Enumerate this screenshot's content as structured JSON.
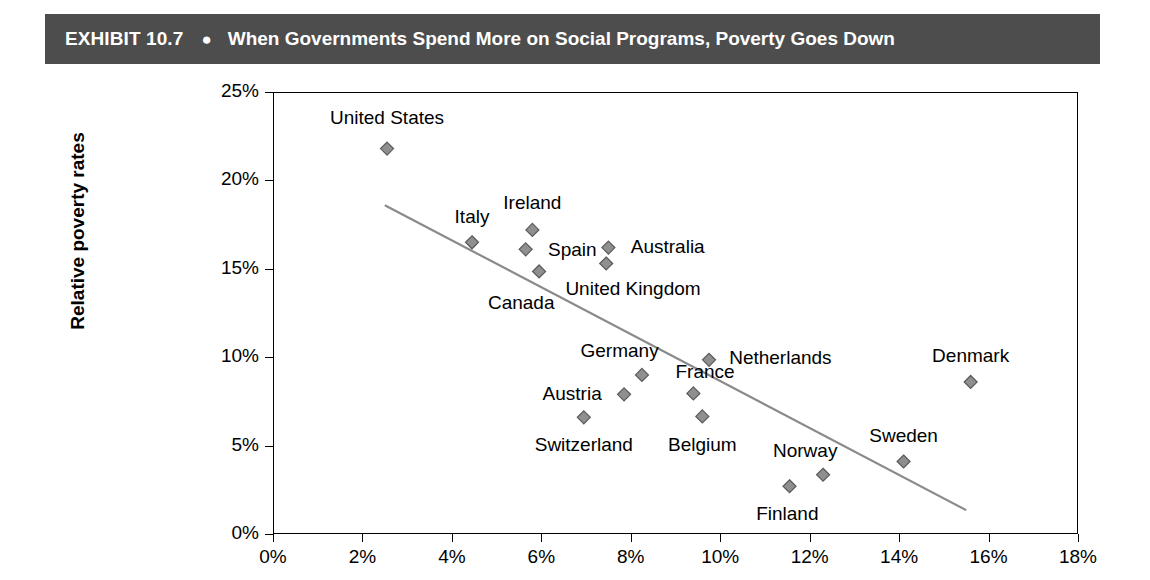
{
  "header": {
    "exhibit_number": "EXHIBIT 10.7",
    "bullet": "●",
    "title": "When Governments Spend More on Social Programs, Poverty Goes Down",
    "bar_color": "#4d4d4d",
    "text_color": "#ffffff"
  },
  "chart_data": {
    "type": "scatter",
    "title": "When Governments Spend More on Social Programs, Poverty Goes Down",
    "xlabel": "",
    "ylabel": "Relative poverty rates",
    "xlim": [
      0,
      18
    ],
    "ylim": [
      0,
      25
    ],
    "grid": false,
    "legend": "none",
    "x_ticks": [
      "0%",
      "2%",
      "4%",
      "6%",
      "8%",
      "10%",
      "12%",
      "14%",
      "16%",
      "18%"
    ],
    "x_tick_values": [
      0,
      2,
      4,
      6,
      8,
      10,
      12,
      14,
      16,
      18
    ],
    "y_ticks": [
      "0%",
      "5%",
      "10%",
      "15%",
      "20%",
      "25%"
    ],
    "y_tick_values": [
      0,
      5,
      10,
      15,
      20,
      25
    ],
    "marker": {
      "shape": "diamond",
      "fill": "#8f8f8f",
      "stroke": "#5a5a5a",
      "size": 13
    },
    "trendline": {
      "x_start": 2.5,
      "y_start": 18.6,
      "x_end": 15.5,
      "y_end": 1.35,
      "color": "#8a8a8a",
      "width": 2.2
    },
    "points": [
      {
        "label": "United States",
        "x": 2.55,
        "y": 21.8,
        "lx": 2.55,
        "ly": 23.6,
        "anchor": "mid"
      },
      {
        "label": "Italy",
        "x": 4.45,
        "y": 16.5,
        "lx": 4.45,
        "ly": 18.0,
        "anchor": "mid"
      },
      {
        "label": "Ireland",
        "x": 5.8,
        "y": 17.2,
        "lx": 5.8,
        "ly": 18.8,
        "anchor": "mid"
      },
      {
        "label": "Spain",
        "x": 5.65,
        "y": 16.1,
        "lx": 6.15,
        "ly": 16.1,
        "anchor": "start"
      },
      {
        "label": "Canada",
        "x": 5.95,
        "y": 14.85,
        "lx": 5.55,
        "ly": 13.1,
        "anchor": "mid"
      },
      {
        "label": "Australia",
        "x": 7.5,
        "y": 16.2,
        "lx": 8.0,
        "ly": 16.3,
        "anchor": "start"
      },
      {
        "label": "United Kingdom",
        "x": 7.45,
        "y": 15.3,
        "lx": 8.05,
        "ly": 13.9,
        "anchor": "mid"
      },
      {
        "label": "Germany",
        "x": 8.25,
        "y": 9.0,
        "lx": 7.75,
        "ly": 10.4,
        "anchor": "mid"
      },
      {
        "label": "Netherlands",
        "x": 9.75,
        "y": 9.85,
        "lx": 10.2,
        "ly": 10.0,
        "anchor": "start"
      },
      {
        "label": "Austria",
        "x": 7.85,
        "y": 7.9,
        "lx": 7.35,
        "ly": 8.0,
        "anchor": "end"
      },
      {
        "label": "France",
        "x": 9.4,
        "y": 7.95,
        "lx": 9.0,
        "ly": 9.2,
        "anchor": "start"
      },
      {
        "label": "Switzerland",
        "x": 6.95,
        "y": 6.6,
        "lx": 6.95,
        "ly": 5.1,
        "anchor": "mid"
      },
      {
        "label": "Belgium",
        "x": 9.6,
        "y": 6.65,
        "lx": 9.6,
        "ly": 5.1,
        "anchor": "mid"
      },
      {
        "label": "Norway",
        "x": 12.3,
        "y": 3.35,
        "lx": 11.9,
        "ly": 4.75,
        "anchor": "mid"
      },
      {
        "label": "Finland",
        "x": 11.55,
        "y": 2.7,
        "lx": 11.5,
        "ly": 1.2,
        "anchor": "mid"
      },
      {
        "label": "Sweden",
        "x": 14.1,
        "y": 4.1,
        "lx": 14.1,
        "ly": 5.6,
        "anchor": "mid"
      },
      {
        "label": "Denmark",
        "x": 15.6,
        "y": 8.6,
        "lx": 15.6,
        "ly": 10.1,
        "anchor": "mid"
      }
    ]
  }
}
